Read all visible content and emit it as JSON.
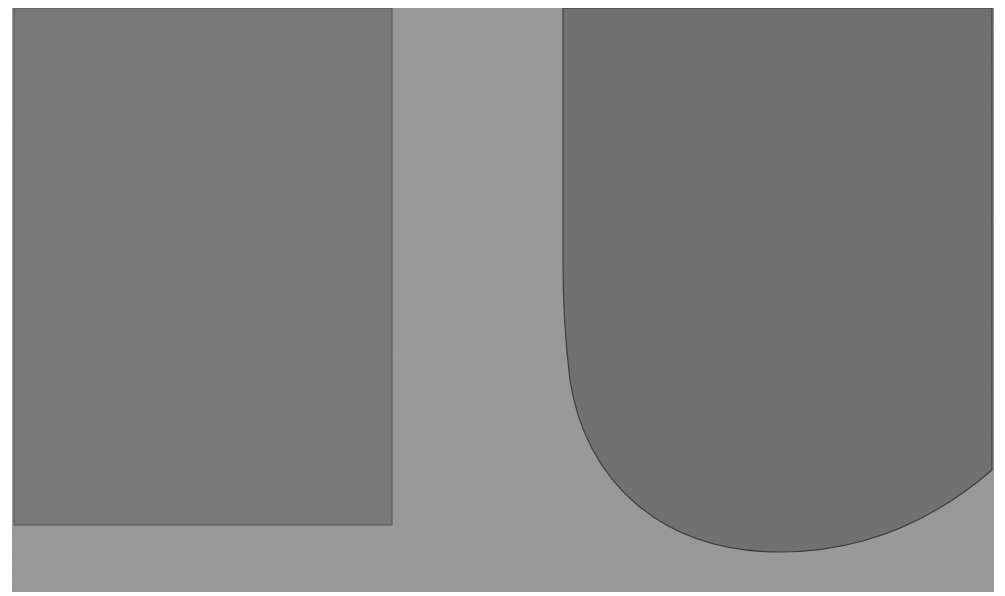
{
  "artwork": {
    "description": "Abstract hard-edge composition in gray tones: a dark rectangle on the left and a dark U-shaped form with a rounded bottom on the right, over a lighter gray ground",
    "colors": {
      "margin": "#ffffff",
      "ground": "#9a9a9a",
      "left_rectangle": "#7a7a7a",
      "right_form": "#727272",
      "edge": "#4a4a4a"
    }
  }
}
